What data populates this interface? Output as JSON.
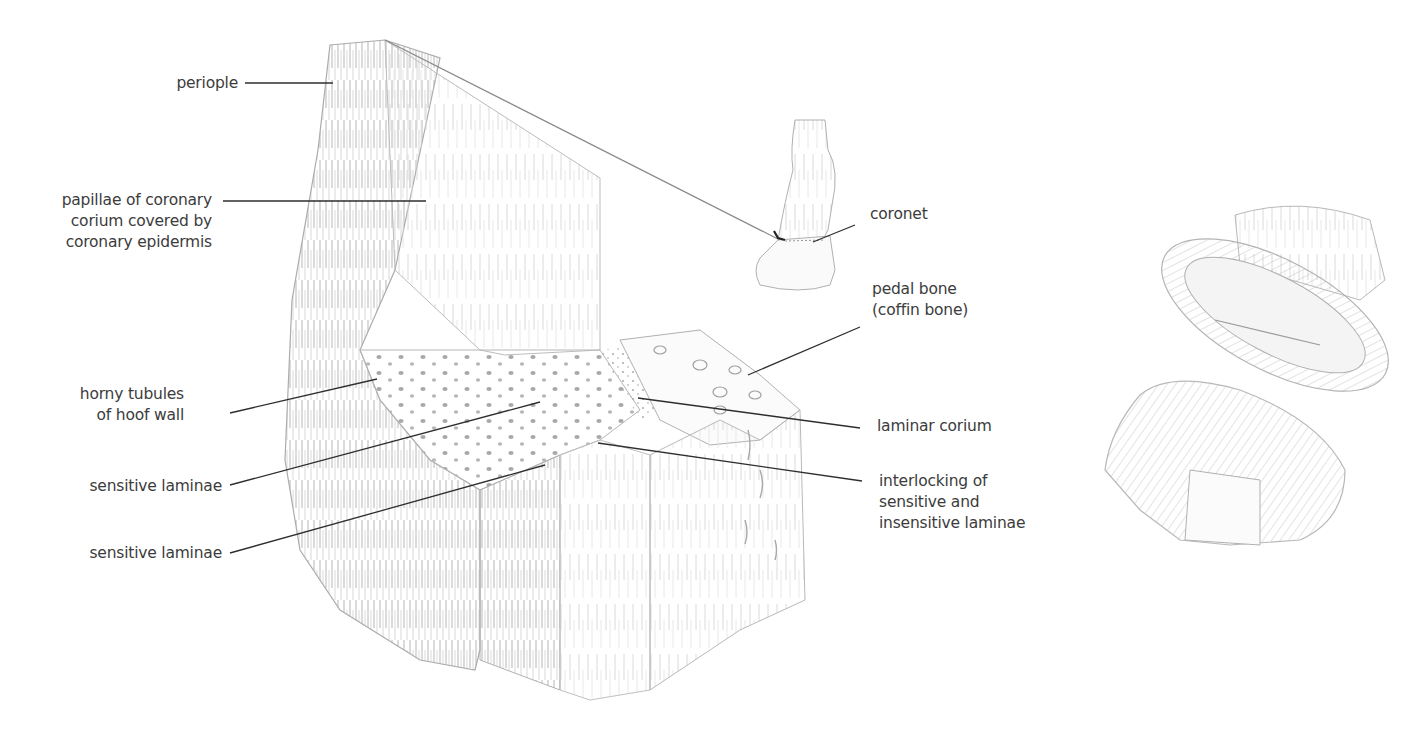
{
  "diagram": {
    "colors": {
      "text": "#3c3c3c",
      "leader_line": "#2e2e2e",
      "sketch_stroke": "#9a9a9a",
      "sketch_shade": "#c8c8c8",
      "background": "#ffffff"
    },
    "labels": [
      {
        "id": "periople",
        "lines": [
          "periople"
        ]
      },
      {
        "id": "papillae",
        "lines": [
          "papillae of coronary",
          "corium covered by",
          "coronary epidermis"
        ]
      },
      {
        "id": "horny-tubules",
        "lines": [
          "horny tubules",
          "of hoof wall"
        ]
      },
      {
        "id": "sensitive-laminae-1",
        "lines": [
          "sensitive laminae"
        ]
      },
      {
        "id": "sensitive-laminae-2",
        "lines": [
          "sensitive laminae"
        ]
      },
      {
        "id": "coronet",
        "lines": [
          "coronet"
        ]
      },
      {
        "id": "pedal-bone",
        "lines": [
          "pedal bone",
          "(coffin bone)"
        ]
      },
      {
        "id": "laminar-corium",
        "lines": [
          "laminar corium"
        ]
      },
      {
        "id": "interlocking",
        "lines": [
          "interlocking of",
          "sensitive and",
          "insensitive laminae"
        ]
      }
    ],
    "illustrations": [
      {
        "id": "hoof-wall-block",
        "description": "cut-away block of hoof wall showing tubules and laminae"
      },
      {
        "id": "lower-leg-inset",
        "description": "small lower leg and hoof showing section location"
      },
      {
        "id": "hoof-capsule-sketch",
        "description": "hoof capsule separated from foot"
      }
    ]
  }
}
